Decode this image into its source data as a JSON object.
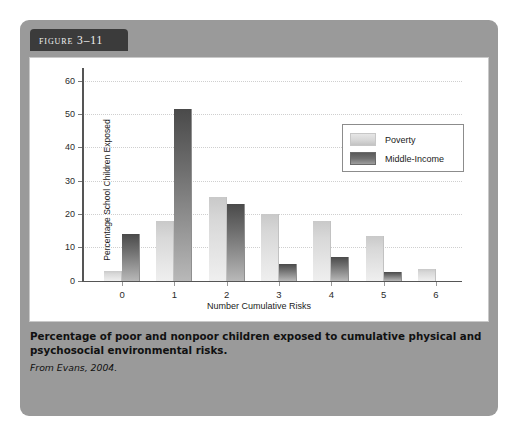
{
  "figure": {
    "badge_label": "Figure 3–11",
    "caption": "Percentage of poor and nonpoor children exposed to cumulative physical and psychosocial environmental risks.",
    "source": "From Evans, 2004."
  },
  "colors": {
    "card_background": "#9a9a9a",
    "badge_background": "#3b3b3b",
    "panel_background": "#ffffff",
    "poverty_bar": "#d8d8d8",
    "middle_income_bar": "#6e6e6e",
    "gridline": "#cfcfcf",
    "axis": "#555555"
  },
  "chart_data": {
    "type": "bar",
    "title": "",
    "xlabel": "Number Cumulative Risks",
    "ylabel": "Percentage School Children Exposed",
    "categories": [
      "0",
      "1",
      "2",
      "3",
      "4",
      "5",
      "6"
    ],
    "series": [
      {
        "name": "Poverty",
        "values": [
          3,
          18,
          25,
          20,
          18,
          13.5,
          3.5
        ]
      },
      {
        "name": "Middle-Income",
        "values": [
          14,
          51.5,
          23,
          5,
          7,
          2.5,
          0
        ]
      }
    ],
    "ylim": [
      0,
      62
    ],
    "yticks": [
      0,
      10,
      20,
      30,
      40,
      50,
      60
    ],
    "xticks": [
      "0",
      "1",
      "2",
      "3",
      "4",
      "5",
      "6"
    ],
    "grid": true,
    "legend_position": "upper-right"
  }
}
